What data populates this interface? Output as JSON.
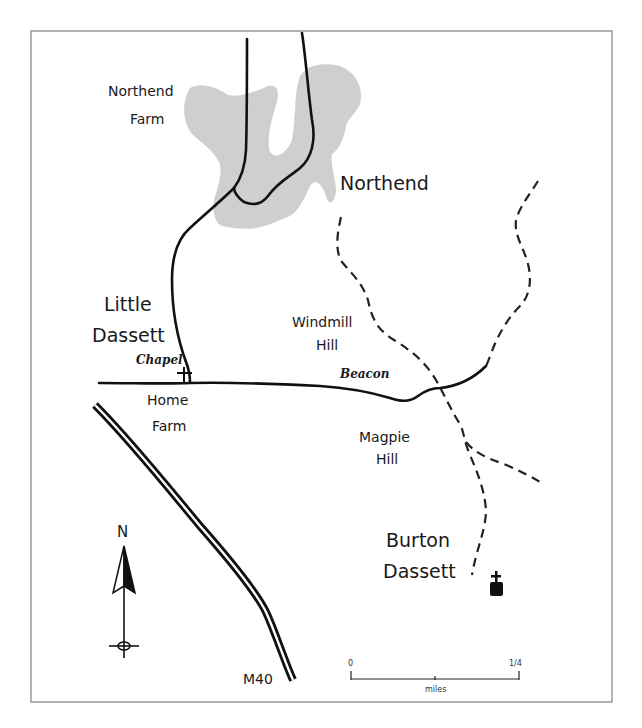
{
  "map": {
    "frame_color": "#8a8a8a",
    "village_fill": "#cfcfcf",
    "labels": {
      "northend_farm": [
        "Northend",
        "Farm"
      ],
      "northend": "Northend",
      "little_dassett": [
        "Little",
        "Dassett"
      ],
      "chapel": "Chapel",
      "home_farm": [
        "Home",
        "Farm"
      ],
      "windmill_hill": [
        "Windmill",
        "Hill"
      ],
      "beacon": "Beacon",
      "magpie_hill": [
        "Magpie",
        "Hill"
      ],
      "burton_dassett": [
        "Burton",
        "Dassett"
      ],
      "motorway": "M40"
    },
    "north_arrow": {
      "label": "N"
    },
    "scale_bar": {
      "start": "0",
      "end": "1/4",
      "unit": "miles"
    },
    "icons": [
      "chapel-cross-icon",
      "church-icon",
      "north-arrow-icon"
    ]
  }
}
